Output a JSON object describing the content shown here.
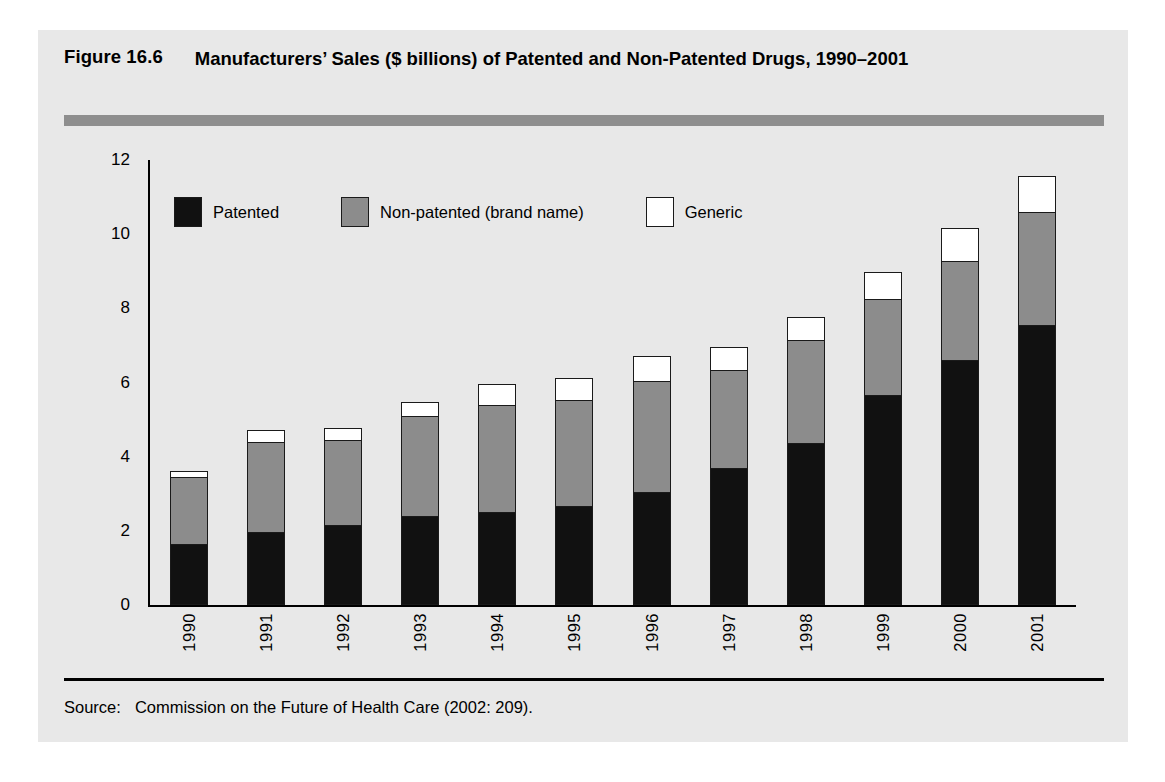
{
  "figure": {
    "number": "Figure 16.6",
    "title": "Manufacturers’ Sales ($ billions) of Patented and Non-Patented Drugs, 1990–2001",
    "source_keyword": "Source:",
    "source_text": "Commission on the Future of Health Care (2002: 209)."
  },
  "colors": {
    "panel_background": "#e8e8e8",
    "rule_bar": "#8e8e8e",
    "patented": "#111111",
    "non_patented": "#8c8c8c",
    "generic": "#ffffff",
    "outline": "#1a1a1a"
  },
  "legend": {
    "position": "inside-top-left",
    "items": [
      {
        "label": "Patented",
        "swatch": "#111111",
        "key": "patented"
      },
      {
        "label": "Non-patented (brand name)",
        "swatch": "#8c8c8c",
        "key": "non_patented"
      },
      {
        "label": "Generic",
        "swatch": "#ffffff",
        "key": "generic"
      }
    ]
  },
  "chart_data": {
    "type": "bar",
    "stacked": true,
    "title": "Manufacturers’ Sales ($ billions) of Patented and Non-Patented Drugs, 1990–2001",
    "xlabel": "",
    "ylabel": "",
    "ylim": [
      0,
      12
    ],
    "yticks": [
      0,
      2,
      4,
      6,
      8,
      10,
      12
    ],
    "ytick_labels": [
      "0",
      "2",
      "4",
      "6",
      "8",
      "10",
      "12"
    ],
    "grid": false,
    "legend_position": "top-left inside plot",
    "units": "$ billions",
    "categories": [
      "1990",
      "1991",
      "1992",
      "1993",
      "1994",
      "1995",
      "1996",
      "1997",
      "1998",
      "1999",
      "2000",
      "2001"
    ],
    "series": [
      {
        "name": "Patented",
        "color": "#111111",
        "values": [
          1.65,
          1.95,
          2.15,
          2.4,
          2.5,
          2.65,
          3.05,
          3.7,
          4.35,
          5.65,
          6.6,
          7.55
        ]
      },
      {
        "name": "Non-patented (brand name)",
        "color": "#8c8c8c",
        "values": [
          1.8,
          2.45,
          2.3,
          2.7,
          2.9,
          2.9,
          3.0,
          2.65,
          2.8,
          2.6,
          2.7,
          3.05
        ]
      },
      {
        "name": "Generic",
        "color": "#ffffff",
        "values": [
          0.2,
          0.35,
          0.35,
          0.4,
          0.6,
          0.6,
          0.7,
          0.65,
          0.65,
          0.75,
          0.9,
          1.0
        ]
      }
    ],
    "totals": [
      3.65,
      4.75,
      4.8,
      5.5,
      6.0,
      6.15,
      6.75,
      7.0,
      7.8,
      9.0,
      10.2,
      11.6
    ]
  }
}
